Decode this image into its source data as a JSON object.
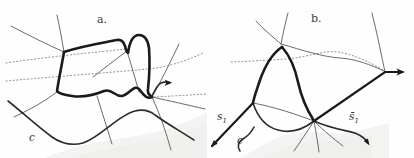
{
  "figure": {
    "panel_a": {
      "label": "a.",
      "curve_label": "c"
    },
    "panel_b": {
      "label": "b.",
      "curve_label": "c",
      "s1": {
        "base": "s",
        "sub": "1"
      },
      "s1_bar": {
        "base": "s̄",
        "sub": "1"
      }
    },
    "colors": {
      "curve_thick": "#1a1a1a",
      "curve_medium": "#2b2b2b",
      "curve_thin": "#5a5a5a",
      "curve_dotted": "#7a7a7a",
      "shading": "#e7e7e4",
      "background": "#fefefe",
      "label_text": "#3c3c3c"
    }
  }
}
